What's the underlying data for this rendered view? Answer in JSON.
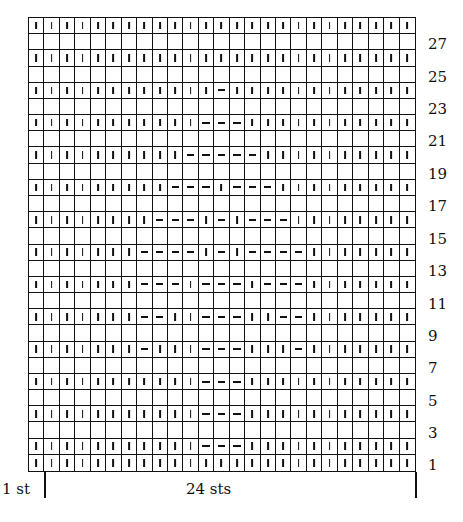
{
  "chart_data": {
    "type": "table",
    "columns": 25,
    "rows_visual": 28,
    "legend": {
      "k": "vertical tick (knit)",
      "p": "horizontal dash (purl)",
      "blank": "empty square"
    },
    "rows_top_to_bottom": [
      {
        "type": "k",
        "purl": []
      },
      {
        "type": "blank"
      },
      {
        "type": "k",
        "purl": []
      },
      {
        "type": "blank"
      },
      {
        "type": "k",
        "purl": [
          13
        ]
      },
      {
        "type": "blank"
      },
      {
        "type": "k",
        "purl": [
          12,
          13,
          14
        ]
      },
      {
        "type": "blank"
      },
      {
        "type": "k",
        "purl": [
          11,
          12,
          13,
          14,
          15
        ]
      },
      {
        "type": "blank"
      },
      {
        "type": "k",
        "purl": [
          10,
          11,
          12,
          14,
          15,
          16
        ]
      },
      {
        "type": "blank"
      },
      {
        "type": "k",
        "purl": [
          9,
          10,
          11,
          13,
          15,
          16,
          17
        ]
      },
      {
        "type": "blank"
      },
      {
        "type": "k",
        "purl": [
          8,
          9,
          10,
          11,
          13,
          15,
          16,
          17,
          18
        ]
      },
      {
        "type": "blank"
      },
      {
        "type": "k",
        "purl": [
          8,
          9,
          10,
          12,
          13,
          14,
          16,
          17,
          18
        ]
      },
      {
        "type": "blank"
      },
      {
        "type": "k",
        "purl": [
          8,
          9,
          12,
          13,
          14,
          17,
          18
        ]
      },
      {
        "type": "blank"
      },
      {
        "type": "k",
        "purl": [
          8,
          12,
          13,
          14,
          18
        ]
      },
      {
        "type": "blank"
      },
      {
        "type": "k",
        "purl": [
          12,
          13,
          14
        ]
      },
      {
        "type": "blank"
      },
      {
        "type": "k",
        "purl": [
          12,
          13,
          14
        ]
      },
      {
        "type": "blank"
      },
      {
        "type": "k",
        "purl": [
          12,
          13,
          14
        ]
      },
      {
        "type": "k",
        "purl": []
      }
    ],
    "row_labels": [
      {
        "text": "27",
        "y": 36
      },
      {
        "text": "25",
        "y": 69
      },
      {
        "text": "23",
        "y": 101
      },
      {
        "text": "21",
        "y": 133
      },
      {
        "text": "19",
        "y": 166
      },
      {
        "text": "17",
        "y": 198
      },
      {
        "text": "15",
        "y": 231
      },
      {
        "text": "13",
        "y": 263
      },
      {
        "text": "11",
        "y": 296
      },
      {
        "text": "9",
        "y": 328
      },
      {
        "text": "7",
        "y": 360
      },
      {
        "text": "5",
        "y": 393
      },
      {
        "text": "3",
        "y": 425
      },
      {
        "text": "1",
        "y": 457
      }
    ],
    "annotations": {
      "edge_stitch": "1 st",
      "repeat": "24 sts"
    }
  }
}
